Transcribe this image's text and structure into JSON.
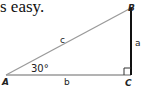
{
  "caption": "s easy.",
  "diagram": {
    "type": "right-triangle",
    "vertices": {
      "A": "A",
      "B": "B",
      "C": "C"
    },
    "sides": {
      "hypotenuse": "c",
      "opposite": "a",
      "adjacent": "b"
    },
    "angle_label": "30°",
    "right_angle_at": "C",
    "colors": {
      "hypotenuse": "#9a9a9a",
      "base": "#9a9a9a",
      "vertical": "#111111"
    }
  }
}
